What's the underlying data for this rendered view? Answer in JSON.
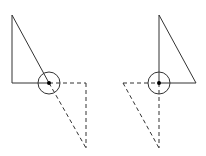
{
  "diagram": {
    "stroke_color": "#333333",
    "figures": [
      {
        "name": "left-figure",
        "solid": {
          "vertical": {
            "x1": 12,
            "y1": 15,
            "x2": 12,
            "y2": 83
          },
          "horizontal": {
            "x1": 12,
            "y1": 83,
            "x2": 49,
            "y2": 83
          },
          "hypotenuse": {
            "x1": 12,
            "y1": 15,
            "x2": 49,
            "y2": 83
          }
        },
        "dashed": {
          "horizontal": {
            "x1": 49,
            "y1": 83,
            "x2": 86,
            "y2": 83
          },
          "vertical": {
            "x1": 86,
            "y1": 83,
            "x2": 86,
            "y2": 148
          },
          "hypotenuse": {
            "x1": 49,
            "y1": 83,
            "x2": 86,
            "y2": 148
          }
        },
        "pivot": {
          "cx": 49,
          "cy": 83,
          "r": 11,
          "dot_r": 2
        }
      },
      {
        "name": "right-figure",
        "solid": {
          "vertical": {
            "x1": 159,
            "y1": 15,
            "x2": 159,
            "y2": 83
          },
          "horizontal": {
            "x1": 159,
            "y1": 83,
            "x2": 196,
            "y2": 83
          },
          "hypotenuse": {
            "x1": 159,
            "y1": 15,
            "x2": 196,
            "y2": 83
          }
        },
        "dashed": {
          "horizontal": {
            "x1": 123,
            "y1": 83,
            "x2": 159,
            "y2": 83
          },
          "vertical": {
            "x1": 159,
            "y1": 83,
            "x2": 159,
            "y2": 148
          },
          "hypotenuse": {
            "x1": 123,
            "y1": 83,
            "x2": 159,
            "y2": 148
          }
        },
        "pivot": {
          "cx": 159,
          "cy": 83,
          "r": 11,
          "dot_r": 2
        }
      }
    ]
  }
}
